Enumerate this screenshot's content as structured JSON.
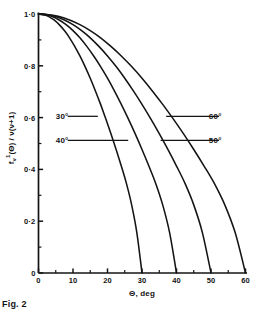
{
  "figure": {
    "caption": "Fig. 2",
    "ink_color": "#141414",
    "background_color": "#ffffff"
  },
  "chart_data": {
    "type": "line",
    "title": "",
    "xlabel": "Θ, deg",
    "ylabel": "fᵥ¹(Θ) / ν(ν+1)",
    "ylabel_parts": {
      "symbol": "f",
      "subscript": "ν",
      "superscript": "1",
      "argument": "(Θ)",
      "divider": " / ",
      "denominator": "ν(ν+1)"
    },
    "xlim": [
      0,
      60
    ],
    "ylim": [
      0,
      1.0
    ],
    "grid": false,
    "legend": "none, curves labelled inline with leader lines",
    "xticks": [
      0,
      10,
      20,
      30,
      40,
      50,
      60
    ],
    "xtick_labels": [
      "0",
      "10",
      "20",
      "30",
      "40",
      "50",
      "60"
    ],
    "xminor_step": 5,
    "yticks": [
      0,
      0.2,
      0.4,
      0.6,
      0.8,
      1.0
    ],
    "ytick_labels": [
      "0",
      "0·2",
      "0·4",
      "0·6",
      "0·8",
      "1·0"
    ],
    "yminor_step": 0.1,
    "series": [
      {
        "name": "30°",
        "label": "30°",
        "cutoff_deg": 30,
        "x": [
          0,
          1.5,
          3,
          4.5,
          6,
          7.5,
          9,
          10.5,
          12,
          13.5,
          15,
          16.5,
          18,
          19.5,
          21,
          22.5,
          24,
          25.5,
          27,
          28.5,
          30
        ],
        "y": [
          1.0,
          0.997,
          0.99,
          0.977,
          0.959,
          0.936,
          0.908,
          0.875,
          0.838,
          0.797,
          0.752,
          0.703,
          0.651,
          0.596,
          0.538,
          0.477,
          0.413,
          0.345,
          0.263,
          0.156,
          0.0
        ]
      },
      {
        "name": "40°",
        "label": "40°",
        "cutoff_deg": 40,
        "x": [
          0,
          2,
          4,
          6,
          8,
          10,
          12,
          14,
          16,
          18,
          20,
          22,
          24,
          26,
          28,
          30,
          32,
          34,
          36,
          38,
          40
        ],
        "y": [
          1.0,
          0.997,
          0.99,
          0.977,
          0.959,
          0.936,
          0.908,
          0.875,
          0.838,
          0.797,
          0.752,
          0.703,
          0.651,
          0.596,
          0.538,
          0.477,
          0.413,
          0.345,
          0.263,
          0.156,
          0.0
        ]
      },
      {
        "name": "50°",
        "label": "50°",
        "cutoff_deg": 50,
        "x": [
          0,
          2.5,
          5,
          7.5,
          10,
          12.5,
          15,
          17.5,
          20,
          22.5,
          25,
          27.5,
          30,
          32.5,
          35,
          37.5,
          40,
          42.5,
          45,
          47.5,
          50
        ],
        "y": [
          1.0,
          0.997,
          0.99,
          0.977,
          0.959,
          0.936,
          0.908,
          0.875,
          0.838,
          0.797,
          0.752,
          0.703,
          0.651,
          0.596,
          0.538,
          0.477,
          0.413,
          0.345,
          0.263,
          0.156,
          0.0
        ]
      },
      {
        "name": "60°",
        "label": "60°",
        "cutoff_deg": 60,
        "x": [
          0,
          3,
          6,
          9,
          12,
          15,
          18,
          21,
          24,
          27,
          30,
          33,
          36,
          39,
          42,
          45,
          48,
          51,
          54,
          57,
          60
        ],
        "y": [
          1.0,
          0.997,
          0.99,
          0.977,
          0.959,
          0.936,
          0.908,
          0.875,
          0.838,
          0.797,
          0.752,
          0.703,
          0.651,
          0.596,
          0.538,
          0.477,
          0.413,
          0.345,
          0.263,
          0.156,
          0.0
        ]
      }
    ],
    "annotations": [
      {
        "text": "30°",
        "series": "30°",
        "text_x_deg": 5.0,
        "y": 0.605,
        "leader_to_x_deg": 17.2,
        "side": "left"
      },
      {
        "text": "60°",
        "series": "60°",
        "text_x_deg": 49.0,
        "y": 0.605,
        "leader_to_x_deg": 37.0,
        "side": "right"
      },
      {
        "text": "40°",
        "series": "40°",
        "text_x_deg": 5.0,
        "y": 0.512,
        "leader_to_x_deg": 26.0,
        "side": "left"
      },
      {
        "text": "50°",
        "series": "50°",
        "text_x_deg": 49.0,
        "y": 0.512,
        "leader_to_x_deg": 35.4,
        "side": "right"
      }
    ]
  }
}
